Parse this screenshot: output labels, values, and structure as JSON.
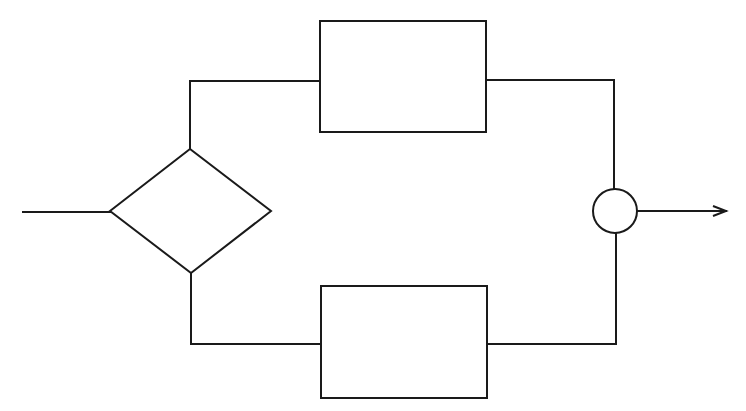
{
  "diagram": {
    "type": "flowchart",
    "width": 746,
    "height": 411,
    "stroke_color": "#1a1a1a",
    "stroke_width": 2,
    "fill_color": "#ffffff",
    "nodes": [
      {
        "id": "decision",
        "shape": "diamond",
        "cx": 190,
        "cy": 211,
        "left": 110,
        "right": 271,
        "top": 149,
        "bottom": 273,
        "label": ""
      },
      {
        "id": "process-top",
        "shape": "rect",
        "x": 320,
        "y": 21,
        "w": 166,
        "h": 111,
        "label": ""
      },
      {
        "id": "process-bottom",
        "shape": "rect",
        "x": 321,
        "y": 286,
        "w": 166,
        "h": 112,
        "label": ""
      },
      {
        "id": "junction",
        "shape": "circle",
        "cx": 615,
        "cy": 211,
        "r": 22,
        "label": ""
      }
    ],
    "edges": [
      {
        "id": "input-line",
        "points": [
          [
            23,
            212
          ],
          [
            110,
            212
          ]
        ],
        "arrow": false
      },
      {
        "id": "decision-to-top",
        "points": [
          [
            190,
            149
          ],
          [
            190,
            81
          ],
          [
            320,
            81
          ]
        ],
        "arrow": false
      },
      {
        "id": "decision-to-bottom",
        "points": [
          [
            191,
            273
          ],
          [
            191,
            344
          ],
          [
            321,
            344
          ]
        ],
        "arrow": false
      },
      {
        "id": "top-to-junction",
        "points": [
          [
            486,
            80
          ],
          [
            614,
            80
          ],
          [
            614,
            189
          ]
        ],
        "arrow": false
      },
      {
        "id": "bottom-to-junction",
        "points": [
          [
            487,
            344
          ],
          [
            616,
            344
          ],
          [
            616,
            233
          ]
        ],
        "arrow": false
      },
      {
        "id": "output-arrow",
        "points": [
          [
            637,
            211
          ],
          [
            726,
            211
          ]
        ],
        "arrow": true
      }
    ]
  }
}
